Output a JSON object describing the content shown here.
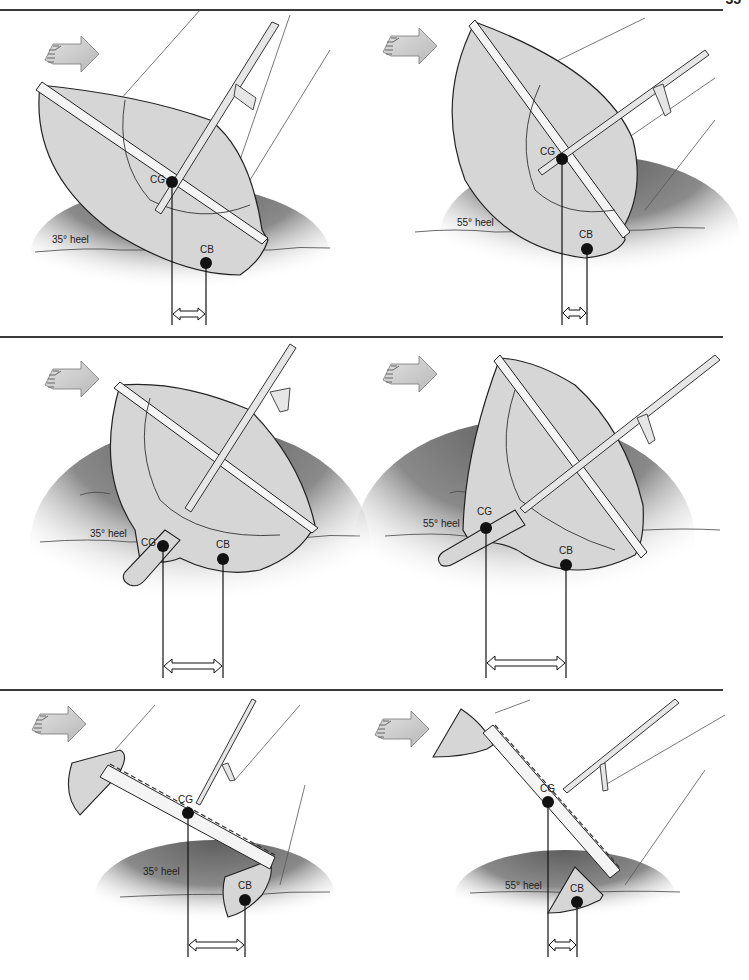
{
  "page": {
    "number": "35"
  },
  "colors": {
    "hull_fill": "#d6d6d6",
    "deck_fill": "#f4f4f4",
    "water_dark": "#6a6a6a",
    "line": "#222222",
    "arrow_fill": "#cfcfcf"
  },
  "labels": {
    "cg": "CG",
    "cb": "CB",
    "wind": "WIND"
  },
  "rows": [
    {
      "name": "monohull-light-displacement",
      "panels": [
        {
          "heel_label": "35° heel",
          "heel_deg": 35,
          "cg_x": 172,
          "cb_x": 206,
          "righting_arm": "short"
        },
        {
          "heel_label": "55° heel",
          "heel_deg": 55,
          "cg_x": 562,
          "cb_x": 587,
          "righting_arm": "very short"
        }
      ]
    },
    {
      "name": "monohull-ballasted-keel",
      "panels": [
        {
          "heel_label": "35° heel",
          "heel_deg": 35,
          "cg_x": 163,
          "cb_x": 223,
          "righting_arm": "long"
        },
        {
          "heel_label": "55° heel",
          "heel_deg": 55,
          "cg_x": 486,
          "cb_x": 566,
          "righting_arm": "longer"
        }
      ]
    },
    {
      "name": "catamaran",
      "panels": [
        {
          "heel_label": "35° heel",
          "heel_deg": 35,
          "cg_x": 188,
          "cb_x": 245,
          "righting_arm": "long"
        },
        {
          "heel_label": "55° heel",
          "heel_deg": 55,
          "cg_x": 548,
          "cb_x": 577,
          "righting_arm": "short"
        }
      ]
    }
  ]
}
